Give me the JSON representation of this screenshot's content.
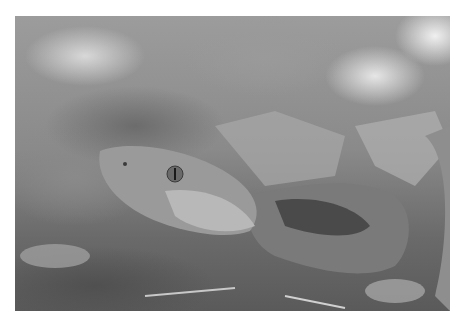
{
  "image": {
    "subject": "copperhead snake",
    "description": "Grayscale close-up photograph of a copperhead snake's head and coiled body resting on dry leaf litter, with a blurred leafy background",
    "tone": "grayscale"
  }
}
